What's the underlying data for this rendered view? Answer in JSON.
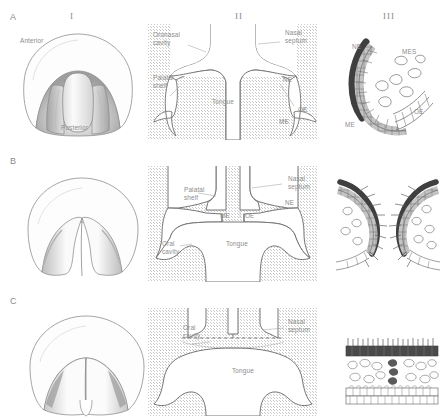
{
  "figure": {
    "colors": {
      "ink": "#6d6d6d",
      "label": "#8c8c8c",
      "stipple": "#c9c9c9",
      "epithelium_dark": "#4a4a4a",
      "epithelium_mid": "#8f8f8f",
      "epithelium_light": "#cfcfcf",
      "shading": "#b0b0b0"
    },
    "columns": [
      {
        "id": "I",
        "numeral": "I",
        "caption": ""
      },
      {
        "id": "II",
        "numeral": "II",
        "caption": ""
      },
      {
        "id": "III",
        "numeral": "III",
        "caption": ""
      }
    ],
    "rows": [
      {
        "id": "A",
        "letter": "A"
      },
      {
        "id": "B",
        "letter": "B"
      },
      {
        "id": "C",
        "letter": "C"
      }
    ]
  },
  "panels": {
    "A_I": {
      "labels": [
        {
          "text": "Anterior",
          "x": 20,
          "y": 37
        },
        {
          "text": "Posterior",
          "x": 61,
          "y": 124
        }
      ]
    },
    "A_II": {
      "labels": [
        {
          "text": "Oronasal",
          "x": 153,
          "y": 35
        },
        {
          "text": "cavity",
          "x": 153,
          "y": 43
        },
        {
          "text": "Nasal",
          "x": 285,
          "y": 33
        },
        {
          "text": "septum",
          "x": 285,
          "y": 41
        },
        {
          "text": "Palatal",
          "x": 153,
          "y": 78
        },
        {
          "text": "shelf",
          "x": 153,
          "y": 86
        },
        {
          "text": "Tongue",
          "x": 212,
          "y": 100
        },
        {
          "text": "NE",
          "x": 283,
          "y": 79
        },
        {
          "text": "OE",
          "x": 298,
          "y": 109
        },
        {
          "text": "ME",
          "x": 279,
          "y": 120
        }
      ]
    },
    "A_III": {
      "labels": [
        {
          "text": "NE",
          "x": 354,
          "y": 45
        },
        {
          "text": "MES",
          "x": 402,
          "y": 50
        },
        {
          "text": "ME",
          "x": 346,
          "y": 123
        },
        {
          "text": "OE",
          "x": 414,
          "y": 110
        }
      ]
    },
    "B_I": {
      "labels": []
    },
    "B_II": {
      "labels": [
        {
          "text": "Palatal",
          "x": 184,
          "y": 189
        },
        {
          "text": "shelf",
          "x": 184,
          "y": 197
        },
        {
          "text": "Nasal",
          "x": 288,
          "y": 178
        },
        {
          "text": "septum",
          "x": 288,
          "y": 186
        },
        {
          "text": "NE",
          "x": 285,
          "y": 202
        },
        {
          "text": "ME",
          "x": 226,
          "y": 215
        },
        {
          "text": "OE",
          "x": 252,
          "y": 215
        },
        {
          "text": "Tongue",
          "x": 232,
          "y": 243
        },
        {
          "text": "Oral",
          "x": 168,
          "y": 243
        },
        {
          "text": "cavity",
          "x": 168,
          "y": 251
        }
      ]
    },
    "B_III": {
      "labels": []
    },
    "C_I": {
      "labels": []
    },
    "C_II": {
      "labels": [
        {
          "text": "Oral",
          "x": 183,
          "y": 332
        },
        {
          "text": "cavity",
          "x": 183,
          "y": 340
        },
        {
          "text": "Nasal",
          "x": 288,
          "y": 326
        },
        {
          "text": "septum",
          "x": 288,
          "y": 334
        },
        {
          "text": "Tongue",
          "x": 238,
          "y": 375
        }
      ]
    },
    "C_III": {
      "labels": []
    }
  },
  "abbreviations": {
    "NE": "Nasal epithelium",
    "OE": "Oral epithelium",
    "ME": "Medial edge epithelium",
    "MES": "Midline epithelial seam"
  }
}
